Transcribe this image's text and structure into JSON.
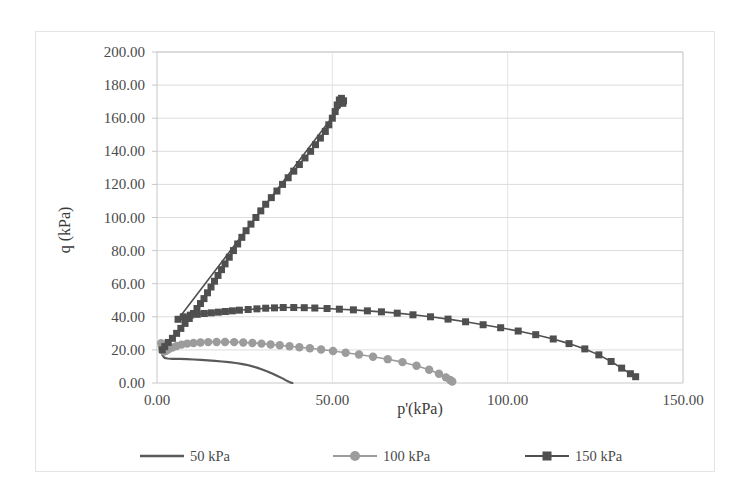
{
  "chart_data": {
    "type": "line",
    "title": "",
    "xlabel": "p'(kPa)",
    "ylabel": "q (kPa)",
    "xlim": [
      0,
      150
    ],
    "ylim": [
      0,
      200
    ],
    "xticks": [
      "0.00",
      "50.00",
      "100.00",
      "150.00"
    ],
    "yticks": [
      "0.00",
      "20.00",
      "40.00",
      "60.00",
      "80.00",
      "100.00",
      "120.00",
      "140.00",
      "160.00",
      "180.00",
      "200.00"
    ],
    "grid": "horizontal",
    "legend_position": "bottom",
    "colors": {
      "series_50": "#5a5a5a",
      "series_100": "#9c9c9c",
      "series_150": "#4f4f4f",
      "gridline": "#dcdcdc",
      "axis": "#c8c8c8",
      "border": "#e4e4e4"
    },
    "series": [
      {
        "name": "50 kPa",
        "marker": "none",
        "color": "#5a5a5a",
        "points": [
          [
            1.5,
            17.0
          ],
          [
            1.8,
            16.0
          ],
          [
            2.2,
            15.2
          ],
          [
            3.0,
            14.8
          ],
          [
            4.5,
            14.6
          ],
          [
            6.5,
            14.6
          ],
          [
            8.5,
            14.4
          ],
          [
            10.5,
            14.2
          ],
          [
            12.5,
            14.0
          ],
          [
            14.5,
            13.7
          ],
          [
            16.5,
            13.4
          ],
          [
            18.5,
            13.0
          ],
          [
            20.5,
            12.6
          ],
          [
            22.5,
            12.1
          ],
          [
            24.0,
            11.6
          ],
          [
            25.5,
            11.0
          ],
          [
            27.0,
            10.2
          ],
          [
            28.5,
            9.3
          ],
          [
            30.0,
            8.2
          ],
          [
            31.5,
            7.0
          ],
          [
            33.0,
            5.6
          ],
          [
            34.5,
            4.1
          ],
          [
            35.8,
            2.8
          ],
          [
            36.8,
            1.6
          ],
          [
            37.6,
            0.7
          ],
          [
            38.2,
            0.2
          ],
          [
            38.6,
            0.0
          ]
        ]
      },
      {
        "name": "100 kPa",
        "marker": "circle",
        "color": "#9c9c9c",
        "points": [
          [
            1.2,
            24.0
          ],
          [
            1.4,
            22.0
          ],
          [
            1.6,
            20.0
          ],
          [
            2.0,
            19.0
          ],
          [
            2.6,
            19.5
          ],
          [
            3.4,
            20.5
          ],
          [
            4.4,
            21.5
          ],
          [
            5.6,
            22.4
          ],
          [
            7.0,
            23.2
          ],
          [
            8.6,
            23.8
          ],
          [
            10.4,
            24.2
          ],
          [
            12.4,
            24.5
          ],
          [
            14.6,
            24.7
          ],
          [
            17.0,
            24.8
          ],
          [
            19.4,
            24.8
          ],
          [
            22.0,
            24.7
          ],
          [
            24.6,
            24.5
          ],
          [
            27.2,
            24.2
          ],
          [
            29.8,
            23.8
          ],
          [
            32.4,
            23.3
          ],
          [
            35.0,
            22.8
          ],
          [
            37.8,
            22.2
          ],
          [
            40.6,
            21.6
          ],
          [
            43.6,
            21.0
          ],
          [
            46.8,
            20.2
          ],
          [
            50.2,
            19.3
          ],
          [
            53.8,
            18.3
          ],
          [
            57.6,
            17.2
          ],
          [
            61.6,
            15.9
          ],
          [
            65.8,
            14.4
          ],
          [
            70.0,
            12.6
          ],
          [
            74.0,
            10.4
          ],
          [
            77.6,
            8.0
          ],
          [
            80.4,
            5.6
          ],
          [
            82.4,
            3.4
          ],
          [
            83.6,
            1.8
          ],
          [
            84.2,
            0.9
          ]
        ]
      },
      {
        "name": "150 kPa",
        "marker": "square",
        "color": "#4f4f4f",
        "points": [
          [
            1.5,
            20.0
          ],
          [
            2.2,
            22.0
          ],
          [
            3.2,
            24.5
          ],
          [
            4.4,
            27.0
          ],
          [
            5.6,
            30.0
          ],
          [
            6.8,
            33.0
          ],
          [
            8.0,
            36.0
          ],
          [
            9.2,
            39.0
          ],
          [
            10.4,
            42.0
          ],
          [
            11.4,
            45.0
          ],
          [
            12.4,
            48.0
          ],
          [
            13.4,
            51.0
          ],
          [
            14.4,
            54.5
          ],
          [
            15.4,
            58.0
          ],
          [
            16.4,
            61.5
          ],
          [
            17.4,
            65.0
          ],
          [
            18.4,
            68.5
          ],
          [
            19.4,
            72.0
          ],
          [
            20.6,
            76.0
          ],
          [
            21.8,
            80.0
          ],
          [
            23.0,
            84.0
          ],
          [
            24.2,
            88.0
          ],
          [
            25.4,
            92.0
          ],
          [
            26.8,
            96.0
          ],
          [
            28.2,
            100.0
          ],
          [
            29.6,
            104.0
          ],
          [
            31.0,
            108.0
          ],
          [
            32.6,
            112.0
          ],
          [
            34.2,
            116.0
          ],
          [
            35.8,
            120.0
          ],
          [
            37.4,
            124.0
          ],
          [
            39.0,
            128.0
          ],
          [
            40.6,
            132.0
          ],
          [
            42.2,
            136.0
          ],
          [
            43.8,
            140.0
          ],
          [
            45.2,
            144.0
          ],
          [
            46.6,
            148.0
          ],
          [
            48.0,
            152.0
          ],
          [
            49.0,
            156.0
          ],
          [
            50.0,
            160.0
          ],
          [
            50.8,
            164.0
          ],
          [
            51.4,
            168.0
          ],
          [
            52.0,
            171.0
          ],
          [
            52.6,
            172.0
          ],
          [
            53.2,
            170.5
          ],
          [
            53.0,
            169.0
          ],
          [
            6.0,
            38.5
          ],
          [
            7.5,
            40.0
          ],
          [
            9.5,
            41.0
          ],
          [
            11.5,
            41.5
          ],
          [
            13.5,
            42.0
          ],
          [
            15.5,
            42.4
          ],
          [
            17.5,
            42.8
          ],
          [
            19.5,
            43.2
          ],
          [
            21.5,
            43.6
          ],
          [
            23.5,
            44.0
          ],
          [
            26.0,
            44.4
          ],
          [
            28.5,
            44.8
          ],
          [
            31.0,
            45.2
          ],
          [
            33.5,
            45.4
          ],
          [
            36.0,
            45.6
          ],
          [
            39.0,
            45.6
          ],
          [
            42.0,
            45.5
          ],
          [
            45.0,
            45.3
          ],
          [
            48.5,
            45.0
          ],
          [
            52.0,
            44.6
          ],
          [
            56.0,
            44.2
          ],
          [
            60.0,
            43.6
          ],
          [
            64.0,
            43.0
          ],
          [
            68.5,
            42.2
          ],
          [
            73.0,
            41.2
          ],
          [
            78.0,
            40.0
          ],
          [
            83.0,
            38.6
          ],
          [
            88.0,
            37.0
          ],
          [
            93.0,
            35.2
          ],
          [
            98.0,
            33.4
          ],
          [
            103.0,
            31.4
          ],
          [
            108.0,
            29.2
          ],
          [
            113.0,
            26.6
          ],
          [
            117.5,
            23.8
          ],
          [
            122.0,
            20.6
          ],
          [
            126.0,
            17.0
          ],
          [
            129.5,
            13.0
          ],
          [
            132.5,
            9.0
          ],
          [
            135.0,
            5.6
          ],
          [
            136.5,
            3.8
          ]
        ]
      }
    ]
  },
  "legend": {
    "items": [
      {
        "label": "50 kPa"
      },
      {
        "label": "100 kPa"
      },
      {
        "label": "150 kPa"
      }
    ]
  }
}
